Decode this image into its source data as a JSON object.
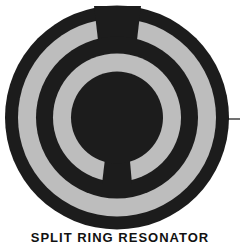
{
  "diagram": {
    "title": "SPLIT RING RESONATOR",
    "colors": {
      "metal": "#1c1c1c",
      "substrate": "#bdbdbd",
      "background": "#ffffff",
      "lead": "#111111"
    },
    "components": [
      {
        "name": "outer-ring",
        "type": "split-ring",
        "gap_position": "top"
      },
      {
        "name": "inner-ring",
        "type": "split-ring",
        "gap_position": "bottom"
      },
      {
        "name": "center-disk",
        "type": "disk"
      },
      {
        "name": "feed-line",
        "type": "lead-line",
        "side": "right"
      }
    ]
  }
}
